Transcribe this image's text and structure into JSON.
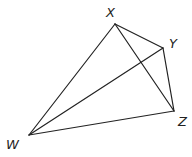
{
  "diagram": {
    "type": "geometric-figure",
    "stroke_color": "#222222",
    "background": "#ffffff",
    "vertices": {
      "X": {
        "x": 115,
        "y": 24,
        "label": "X",
        "label_x": 106,
        "label_y": 17
      },
      "Y": {
        "x": 163,
        "y": 48,
        "label": "Y",
        "label_x": 169,
        "label_y": 48
      },
      "Z": {
        "x": 174,
        "y": 111,
        "label": "Z",
        "label_x": 178,
        "label_y": 126
      },
      "W": {
        "x": 29,
        "y": 135,
        "label": "W",
        "label_x": 6,
        "label_y": 149
      }
    },
    "edges": [
      {
        "from": "W",
        "to": "X"
      },
      {
        "from": "X",
        "to": "Y"
      },
      {
        "from": "Y",
        "to": "Z"
      },
      {
        "from": "Z",
        "to": "W"
      },
      {
        "from": "X",
        "to": "Z"
      },
      {
        "from": "W",
        "to": "Y"
      }
    ]
  }
}
